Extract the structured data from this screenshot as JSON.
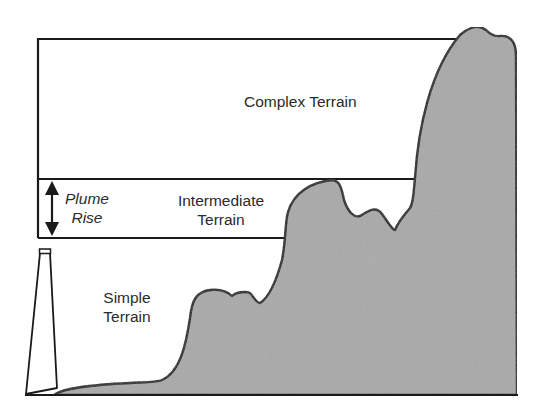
{
  "diagram": {
    "regions": [
      {
        "id": "complex",
        "label": "Complex Terrain"
      },
      {
        "id": "intermediate",
        "label_line1": "Intermediate",
        "label_line2": "Terrain"
      },
      {
        "id": "simple",
        "label_line1": "Simple",
        "label_line2": "Terrain"
      }
    ],
    "annotations": {
      "plume_rise_line1": "Plume",
      "plume_rise_line2": "Rise"
    },
    "elements": [
      "stack",
      "terrain-profile",
      "stack-top-height-line",
      "plume-height-line",
      "plume-rise-arrow"
    ],
    "colors": {
      "line": "#1a1a1a",
      "terrain_fill": "#a9a9a9",
      "text": "#2a2a2a",
      "background": "#ffffff"
    }
  }
}
